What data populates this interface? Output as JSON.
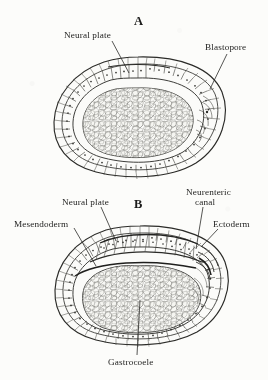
{
  "figure": {
    "background_color": "#fcfcfa",
    "ink_color": "#262624",
    "panels": [
      {
        "letter": "A",
        "labels": [
          {
            "name": "neural-plate",
            "text": "Neural plate"
          },
          {
            "name": "blastopore",
            "text": "Blastopore"
          }
        ]
      },
      {
        "letter": "B",
        "labels": [
          {
            "name": "neural-plate",
            "text": "Neural plate"
          },
          {
            "name": "mesendoderm",
            "text": "Mesendoderm"
          },
          {
            "name": "neurenteric-canal-line1",
            "text": "Neurenteric"
          },
          {
            "name": "neurenteric-canal-line2",
            "text": "canal"
          },
          {
            "name": "ectoderm",
            "text": "Ectoderm"
          },
          {
            "name": "gastrocoele",
            "text": "Gastrocoele"
          }
        ]
      }
    ]
  },
  "panel_a": {
    "letter": "A",
    "label_neural_plate": "Neural plate",
    "label_blastopore": "Blastopore"
  },
  "panel_b": {
    "letter": "B",
    "label_neural_plate": "Neural plate",
    "label_mesendoderm": "Mesendoderm",
    "label_neurenteric_line1": "Neurenteric",
    "label_neurenteric_line2": "canal",
    "label_ectoderm": "Ectoderm",
    "label_gastrocoele": "Gastrocoele"
  }
}
